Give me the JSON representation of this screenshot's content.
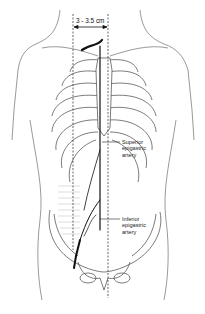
{
  "figure": {
    "type": "anatomical-diagram",
    "measurement": {
      "label": "3 - 3.5 cm"
    },
    "labels": [
      {
        "id": "superior",
        "lines": [
          "Superior",
          "epigastric",
          "artery"
        ]
      },
      {
        "id": "inferior",
        "lines": [
          "Inferior",
          "epigastric",
          "artery"
        ]
      }
    ],
    "colors": {
      "line": "#333333",
      "artery": "#1a1a1a",
      "shading": "#c8c8c8"
    }
  }
}
